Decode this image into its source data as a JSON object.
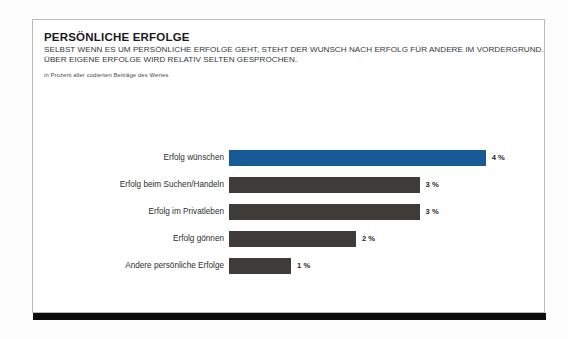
{
  "page": {
    "title": "PERSÖNLICHE ERFOLGE",
    "subtitle_line_1": "SELBST WENN ES UM PERSÖNLICHE ERFOLGE GEHT, STEHT DER WUNSCH NACH ERFOLG FÜR ANDERE IM VORDERGRUND.",
    "subtitle_line_2": "ÜBER EIGENE ERFOLGE WIRD RELATIV SELTEN GESPROCHEN.",
    "note": "in Prozent aller codierten Beiträge des Wertes"
  },
  "colors": {
    "highlight_bar": "#175b96",
    "default_bar": "#3f3b39",
    "footer_rule": "#0c0c0c",
    "frame_border": "#b9bcbe",
    "text": "#1b1b1b"
  },
  "chart_data": {
    "type": "bar",
    "orientation": "horizontal",
    "title": "PERSÖNLICHE ERFOLGE",
    "subtitle": "SELBST WENN ES UM PERSÖNLICHE ERFOLGE GEHT, STEHT DER WUNSCH NACH ERFOLG FÜR ANDERE IM VORDERGRUND. ÜBER EIGENE ERFOLGE WIRD RELATIV SELTEN GESPROCHEN.",
    "xlabel": "",
    "ylabel": "",
    "unit": "%",
    "note": "in Prozent aller codierten Beiträge des Wertes",
    "xlim": [
      0,
      5
    ],
    "grid": false,
    "legend": false,
    "categories": [
      "Erfolg wünschen",
      "Erfolg beim Suchen/Handeln",
      "Erfolg im Privatleben",
      "Erfolg gönnen",
      "Andere persönliche Erfolge"
    ],
    "values": [
      4,
      3,
      3,
      2,
      1
    ],
    "value_labels": [
      "4 %",
      "3 %",
      "3 %",
      "2 %",
      "1 %"
    ],
    "bar_colors": [
      "#175b96",
      "#3f3b39",
      "#3f3b39",
      "#3f3b39",
      "#3f3b39"
    ],
    "bars": [
      {
        "label": "Erfolg wünschen",
        "value": 4,
        "value_label": "4 %",
        "color": "#175b96",
        "width_pct": 81.5
      },
      {
        "label": "Erfolg beim Suchen/Handeln",
        "value": 3,
        "value_label": "3 %",
        "color": "#3f3b39",
        "width_pct": 60.5
      },
      {
        "label": "Erfolg im Privatleben",
        "value": 3,
        "value_label": "3 %",
        "color": "#3f3b39",
        "width_pct": 60.5
      },
      {
        "label": "Erfolg gönnen",
        "value": 2,
        "value_label": "2 %",
        "color": "#3f3b39",
        "width_pct": 40.3
      },
      {
        "label": "Andere persönliche Erfolge",
        "value": 1,
        "value_label": "1 %",
        "color": "#3f3b39",
        "width_pct": 19.7
      }
    ]
  }
}
